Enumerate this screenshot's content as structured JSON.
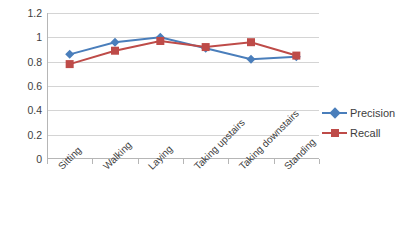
{
  "chart_data": {
    "type": "line",
    "title": "",
    "xlabel": "",
    "ylabel": "",
    "categories": [
      "Sitting",
      "Walking",
      "Laying",
      "Taking upstairs",
      "Taking downstairs",
      "Standing"
    ],
    "series": [
      {
        "name": "Precision",
        "color": "#4A7EBB",
        "marker": "diamond",
        "values": [
          0.86,
          0.96,
          1.0,
          0.91,
          0.82,
          0.84
        ]
      },
      {
        "name": "Recall",
        "color": "#BE4B48",
        "marker": "square",
        "values": [
          0.78,
          0.89,
          0.97,
          0.92,
          0.96,
          0.85
        ]
      }
    ],
    "ylim": [
      0,
      1.2
    ],
    "yticks": [
      0,
      0.2,
      0.4,
      0.6,
      0.8,
      1,
      1.2
    ],
    "ytick_labels": [
      "0",
      "0.2",
      "0.4",
      "0.6",
      "0.8",
      "1",
      "1.2"
    ],
    "grid": true,
    "grid_axis": "y",
    "legend_position": "right",
    "background": "#ffffff",
    "gridline_color": "#d4d4d4",
    "axis_color": "#b6b6b6",
    "text_color": "#3d3d3d"
  }
}
